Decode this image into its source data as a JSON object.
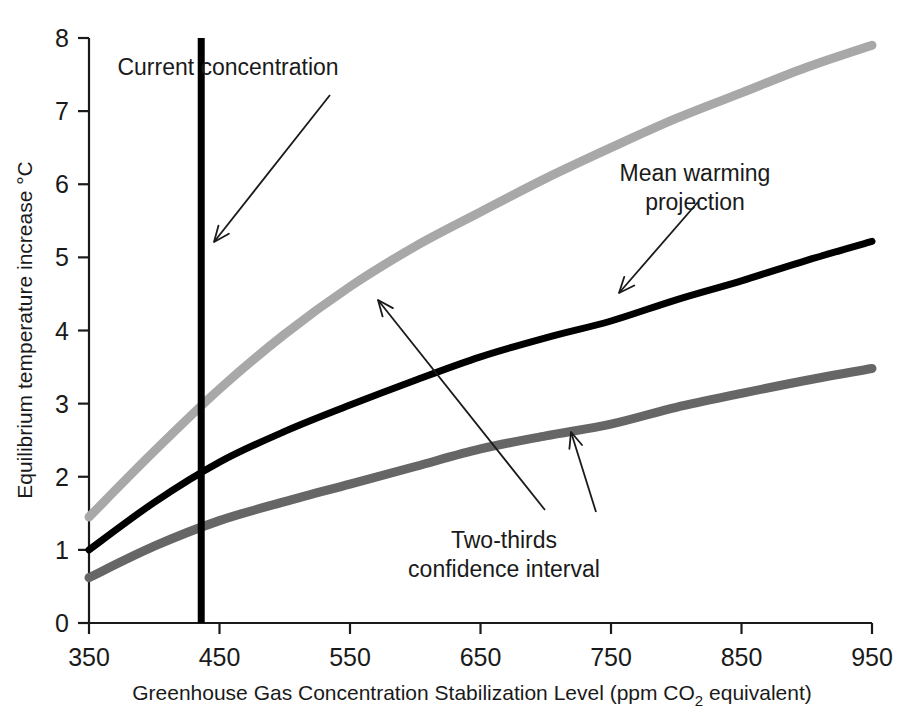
{
  "chart_data": {
    "type": "line",
    "title": "",
    "xlabel": "Greenhouse Gas Concentration Stabilization Level (ppm CO2 equivalent)",
    "xlabel_main": "Greenhouse Gas Concentration Stabilization Level (ppm CO",
    "xlabel_sub": "2",
    "xlabel_tail": " equivalent)",
    "ylabel": "Equilibrium temperature increase °C",
    "xlim": [
      350,
      950
    ],
    "ylim": [
      0,
      8
    ],
    "xticks": [
      350,
      450,
      550,
      650,
      750,
      850,
      950
    ],
    "xtick_labels": [
      "350",
      "450",
      "550",
      "650",
      "750",
      "850",
      "950"
    ],
    "yticks": [
      0,
      1,
      2,
      3,
      4,
      5,
      6,
      7,
      8
    ],
    "ytick_labels": [
      "0",
      "1",
      "2",
      "3",
      "4",
      "5",
      "6",
      "7",
      "8"
    ],
    "grid": false,
    "legend_position": "none",
    "x": [
      350,
      400,
      450,
      500,
      550,
      600,
      650,
      700,
      750,
      800,
      850,
      900,
      950
    ],
    "series": [
      {
        "name": "Two-thirds confidence interval upper bound",
        "color": "#a8a8a8",
        "stroke_width": 9,
        "values": [
          1.45,
          2.35,
          3.2,
          3.95,
          4.6,
          5.15,
          5.62,
          6.08,
          6.5,
          6.9,
          7.25,
          7.6,
          7.9
        ]
      },
      {
        "name": "Mean warming projection",
        "color": "#000000",
        "stroke_width": 7,
        "values": [
          1.0,
          1.65,
          2.2,
          2.62,
          2.98,
          3.32,
          3.64,
          3.9,
          4.13,
          4.42,
          4.68,
          4.96,
          5.22
        ]
      },
      {
        "name": "Two-thirds confidence interval lower bound",
        "color": "#666666",
        "stroke_width": 9,
        "values": [
          0.62,
          1.05,
          1.4,
          1.66,
          1.9,
          2.14,
          2.38,
          2.56,
          2.72,
          2.95,
          3.14,
          3.32,
          3.48
        ]
      }
    ],
    "markers": [
      {
        "name": "current-concentration-line",
        "type": "vline",
        "x": 436,
        "y_from": 0,
        "y_to": 8,
        "color": "#000000",
        "stroke_width": 7
      }
    ],
    "annotations": [
      {
        "name": "current-concentration",
        "text": "Current concentration",
        "lines": [
          "Current concentration"
        ],
        "text_x": 228,
        "text_y": 75,
        "arrow_from": [
          330,
          95
        ],
        "arrow_to": [
          214,
          242
        ]
      },
      {
        "name": "mean-warming-projection",
        "text": "Mean warming projection",
        "lines": [
          "Mean warming",
          "projection"
        ],
        "text_x": 695,
        "text_y": 181,
        "arrow_from": [
          698,
          202
        ],
        "arrow_to": [
          619,
          293
        ]
      },
      {
        "name": "two-thirds-confidence-interval",
        "text": "Two-thirds confidence interval",
        "lines": [
          "Two-thirds",
          "confidence interval"
        ],
        "text_x": 504,
        "text_y": 548,
        "arrow_from": [
          545,
          510
        ],
        "arrow_to": [
          378,
          300
        ],
        "arrow2_from": [
          596,
          512
        ],
        "arrow2_to": [
          571,
          432
        ]
      }
    ]
  },
  "colors": {
    "upper_bound": "#a8a8a8",
    "mean": "#000000",
    "lower_bound": "#666666",
    "axis": "#1a1a1a",
    "background": "#ffffff"
  }
}
